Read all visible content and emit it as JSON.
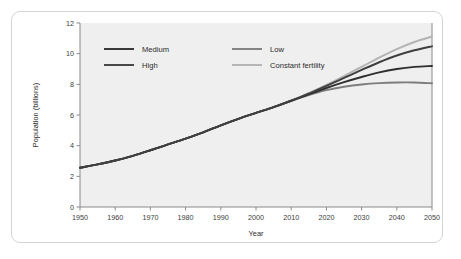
{
  "figure": {
    "frame_color": "#d4d4d4",
    "plot_background": "#efefef",
    "page_background": "#ffffff"
  },
  "chart_data": {
    "type": "line",
    "title": "",
    "subtitle": "",
    "xlabel": "Year",
    "ylabel": "Population (billions)",
    "xlim": [
      1950,
      2050
    ],
    "ylim": [
      0,
      12
    ],
    "xticks": [
      1950,
      1960,
      1970,
      1980,
      1990,
      2000,
      2010,
      2020,
      2030,
      2040,
      2050
    ],
    "yticks": [
      0,
      2,
      4,
      6,
      8,
      10,
      12
    ],
    "xtick_labels": [
      "1950",
      "1960",
      "1970",
      "1980",
      "1990",
      "2000",
      "2010",
      "2020",
      "2030",
      "2040",
      "2050"
    ],
    "ytick_labels": [
      "0",
      "2",
      "4",
      "6",
      "8",
      "10",
      "12"
    ],
    "grid": false,
    "legend_position": "upper-left-inside",
    "x": [
      1950,
      1955,
      1960,
      1965,
      1970,
      1975,
      1980,
      1985,
      1990,
      1995,
      2000,
      2005,
      2010,
      2015,
      2020,
      2025,
      2030,
      2035,
      2040,
      2045,
      2050
    ],
    "series": [
      {
        "name": "Medium",
        "color": "#2f2f2f",
        "width": 1.9,
        "values": [
          2.56,
          2.78,
          3.03,
          3.34,
          3.7,
          4.08,
          4.46,
          4.87,
          5.33,
          5.75,
          6.14,
          6.52,
          6.93,
          7.35,
          7.76,
          8.14,
          8.48,
          8.78,
          9.0,
          9.14,
          9.2
        ]
      },
      {
        "name": "High",
        "color": "#3f3f3f",
        "width": 1.9,
        "values": [
          2.56,
          2.78,
          3.03,
          3.34,
          3.7,
          4.08,
          4.46,
          4.87,
          5.33,
          5.75,
          6.14,
          6.52,
          6.93,
          7.4,
          7.9,
          8.42,
          8.94,
          9.44,
          9.88,
          10.22,
          10.48
        ]
      },
      {
        "name": "Low",
        "color": "#7d7d7d",
        "width": 1.9,
        "values": [
          2.56,
          2.78,
          3.03,
          3.34,
          3.7,
          4.08,
          4.46,
          4.87,
          5.33,
          5.75,
          6.14,
          6.52,
          6.93,
          7.3,
          7.62,
          7.84,
          7.99,
          8.08,
          8.12,
          8.12,
          8.07
        ]
      },
      {
        "name": "Constant fertility",
        "color": "#b3b3b3",
        "width": 1.9,
        "values": [
          2.56,
          2.78,
          3.03,
          3.34,
          3.7,
          4.08,
          4.46,
          4.87,
          5.33,
          5.75,
          6.14,
          6.52,
          6.93,
          7.42,
          7.96,
          8.54,
          9.14,
          9.74,
          10.3,
          10.76,
          11.12
        ]
      }
    ],
    "annotations": []
  },
  "legend": {
    "entries": [
      {
        "label": "Medium",
        "color": "#2f2f2f"
      },
      {
        "label": "Low",
        "color": "#7d7d7d"
      },
      {
        "label": "High",
        "color": "#3f3f3f"
      },
      {
        "label": "Constant fertility",
        "color": "#b3b3b3"
      }
    ]
  }
}
